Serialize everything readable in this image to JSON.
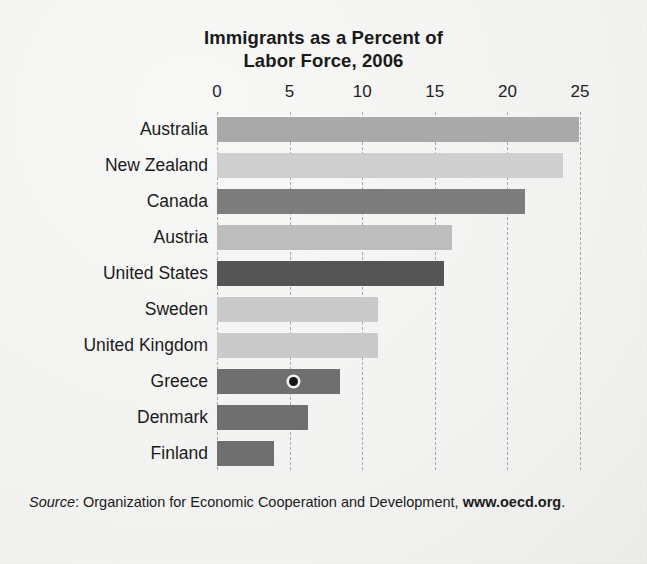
{
  "chart_data": {
    "type": "bar",
    "orientation": "horizontal",
    "title": "Immigrants as a Percent of Labor Force, 2006",
    "title_line1": "Immigrants as a Percent of",
    "title_line2": "Labor Force, 2006",
    "xlabel": "",
    "ylabel": "",
    "xlim": [
      0,
      25
    ],
    "xticks": [
      0,
      5,
      10,
      15,
      20,
      25
    ],
    "xtick_labels": [
      "0",
      "5",
      "10",
      "15",
      "20",
      "25"
    ],
    "grid": "vertical-dashed",
    "legend": "none",
    "categories": [
      "Australia",
      "New Zealand",
      "Canada",
      "Austria",
      "United States",
      "Sweden",
      "United Kingdom",
      "Greece",
      "Denmark",
      "Finland"
    ],
    "values": [
      24.9,
      23.8,
      21.2,
      16.2,
      15.6,
      11.1,
      11.1,
      8.5,
      6.3,
      3.9
    ],
    "bar_colors": [
      "#a9a9a9",
      "#cfcfcf",
      "#7d7d7d",
      "#bdbdbd",
      "#555555",
      "#cacaca",
      "#cacaca",
      "#6f6f6f",
      "#6f6f6f",
      "#6f6f6f"
    ],
    "bars": [
      {
        "label": "Australia",
        "value": 24.9,
        "color": "#a9a9a9"
      },
      {
        "label": "New Zealand",
        "value": 23.8,
        "color": "#cfcfcf"
      },
      {
        "label": "Canada",
        "value": 21.2,
        "color": "#7d7d7d"
      },
      {
        "label": "Austria",
        "value": 16.2,
        "color": "#bdbdbd"
      },
      {
        "label": "United States",
        "value": 15.6,
        "color": "#555555"
      },
      {
        "label": "Sweden",
        "value": 11.1,
        "color": "#cacaca"
      },
      {
        "label": "United Kingdom",
        "value": 11.1,
        "color": "#cacaca"
      },
      {
        "label": "Greece",
        "value": 8.5,
        "color": "#6f6f6f"
      },
      {
        "label": "Denmark",
        "value": 6.3,
        "color": "#6f6f6f"
      },
      {
        "label": "Finland",
        "value": 3.9,
        "color": "#6f6f6f"
      }
    ],
    "annotations": [
      {
        "name": "ink-dot-marker",
        "on_bar": "Greece",
        "x_value": 5.3
      }
    ]
  },
  "source": {
    "label": "Source",
    "separator": ": ",
    "text": "Organization for Economic Cooperation and Development,",
    "url": "www.oecd.org",
    "period": "."
  }
}
